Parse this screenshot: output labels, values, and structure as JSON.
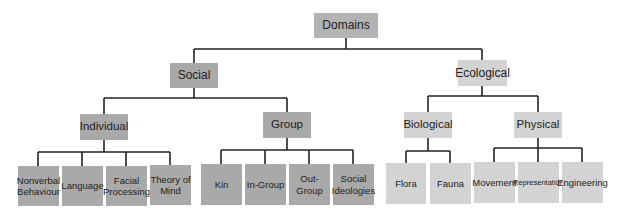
{
  "diagram": {
    "type": "tree",
    "root": {
      "label": "Domains",
      "color": "#b3b3b3"
    },
    "branches": [
      {
        "label": "Social",
        "color": "#a9a9a9",
        "children": [
          {
            "label": "Individual",
            "children": [
              "Nonverbal Behaviour",
              "Language",
              "Facial Processing",
              "Theory of Mind"
            ]
          },
          {
            "label": "Group",
            "children": [
              "Kin",
              "In-Group",
              "Out-Group",
              "Social Ideologies"
            ]
          }
        ]
      },
      {
        "label": "Ecological",
        "color": "#d3d3d3",
        "children": [
          {
            "label": "Biological",
            "children": [
              "Flora",
              "Fauna"
            ]
          },
          {
            "label": "Physical",
            "children": [
              "Movement",
              "Representation",
              "Engineering"
            ]
          }
        ]
      }
    ]
  },
  "labels": {
    "domains": "Domains",
    "social": "Social",
    "ecological": "Ecological",
    "individual": "Individual",
    "group": "Group",
    "biological": "Biological",
    "physical": "Physical",
    "nonverbal": "Nonverbal Behaviour",
    "language": "Language",
    "facial": "Facial Processing",
    "theory": "Theory of Mind",
    "kin": "Kin",
    "ingroup": "In-Group",
    "outgroup": "Out-Group",
    "ideologies": "Social Ideologies",
    "flora": "Flora",
    "fauna": "Fauna",
    "movement": "Movement",
    "representation": "Representation",
    "engineering": "Engineering"
  }
}
